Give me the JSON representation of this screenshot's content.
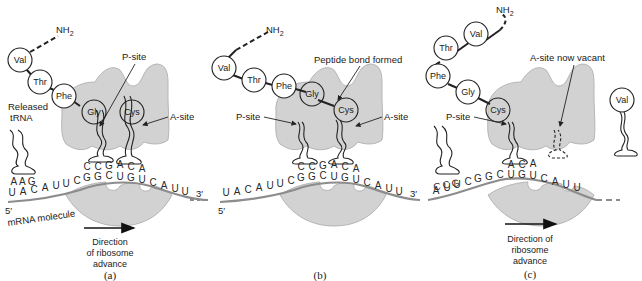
{
  "figure": {
    "panels": [
      {
        "id": "a",
        "caption": "(a)",
        "amino_acid_chain": [
          "Val",
          "Thr",
          "Phe",
          "Gly"
        ],
        "amino_terminus": "NH2",
        "p_site_aa": "Gly",
        "a_site_aa": "Cys",
        "labels": {
          "p_site": "P-site",
          "a_site": "A-site",
          "released_trna": "Released",
          "released_trna_2": "tRNA",
          "released_anticodon": "AAG",
          "five_prime": "5′",
          "three_prime": "3′",
          "mrna": "mRNA molecule",
          "direction_1": "Direction",
          "direction_2": "of ribosome",
          "direction_3": "advance"
        },
        "anticodons": "CCGACA",
        "mrna_sequence": "UACAUUCGGCUGUCAUU"
      },
      {
        "id": "b",
        "caption": "(b)",
        "amino_acid_chain": [
          "Val",
          "Thr",
          "Phe",
          "Gly",
          "Cys"
        ],
        "amino_terminus": "NH2",
        "labels": {
          "peptide_bond": "Peptide bond formed",
          "p_site": "P-site",
          "a_site": "A-site",
          "five_prime": "5′",
          "three_prime": "3′"
        },
        "anticodons": "CCGACA",
        "mrna_sequence": "UACAUUCGGCUGUCAUU"
      },
      {
        "id": "c",
        "caption": "(c)",
        "amino_acid_chain": [
          "Val",
          "Thr",
          "Phe",
          "Gly",
          "Cys"
        ],
        "amino_terminus": "NH2",
        "incoming_aa": "Val",
        "labels": {
          "a_site_vacant": "A-site now vacant",
          "p_site": "P-site",
          "released_anticodon": "CCG",
          "direction_1": "Direction of",
          "direction_2": "ribosome",
          "direction_3": "advance"
        },
        "anticodons": "ACA",
        "mrna_sequence": "AUUCGGCUGUCAUU"
      }
    ],
    "colors": {
      "ribosome": "#d2d2d2",
      "mrna": "#8c8c8c",
      "ink": "#222222"
    }
  }
}
